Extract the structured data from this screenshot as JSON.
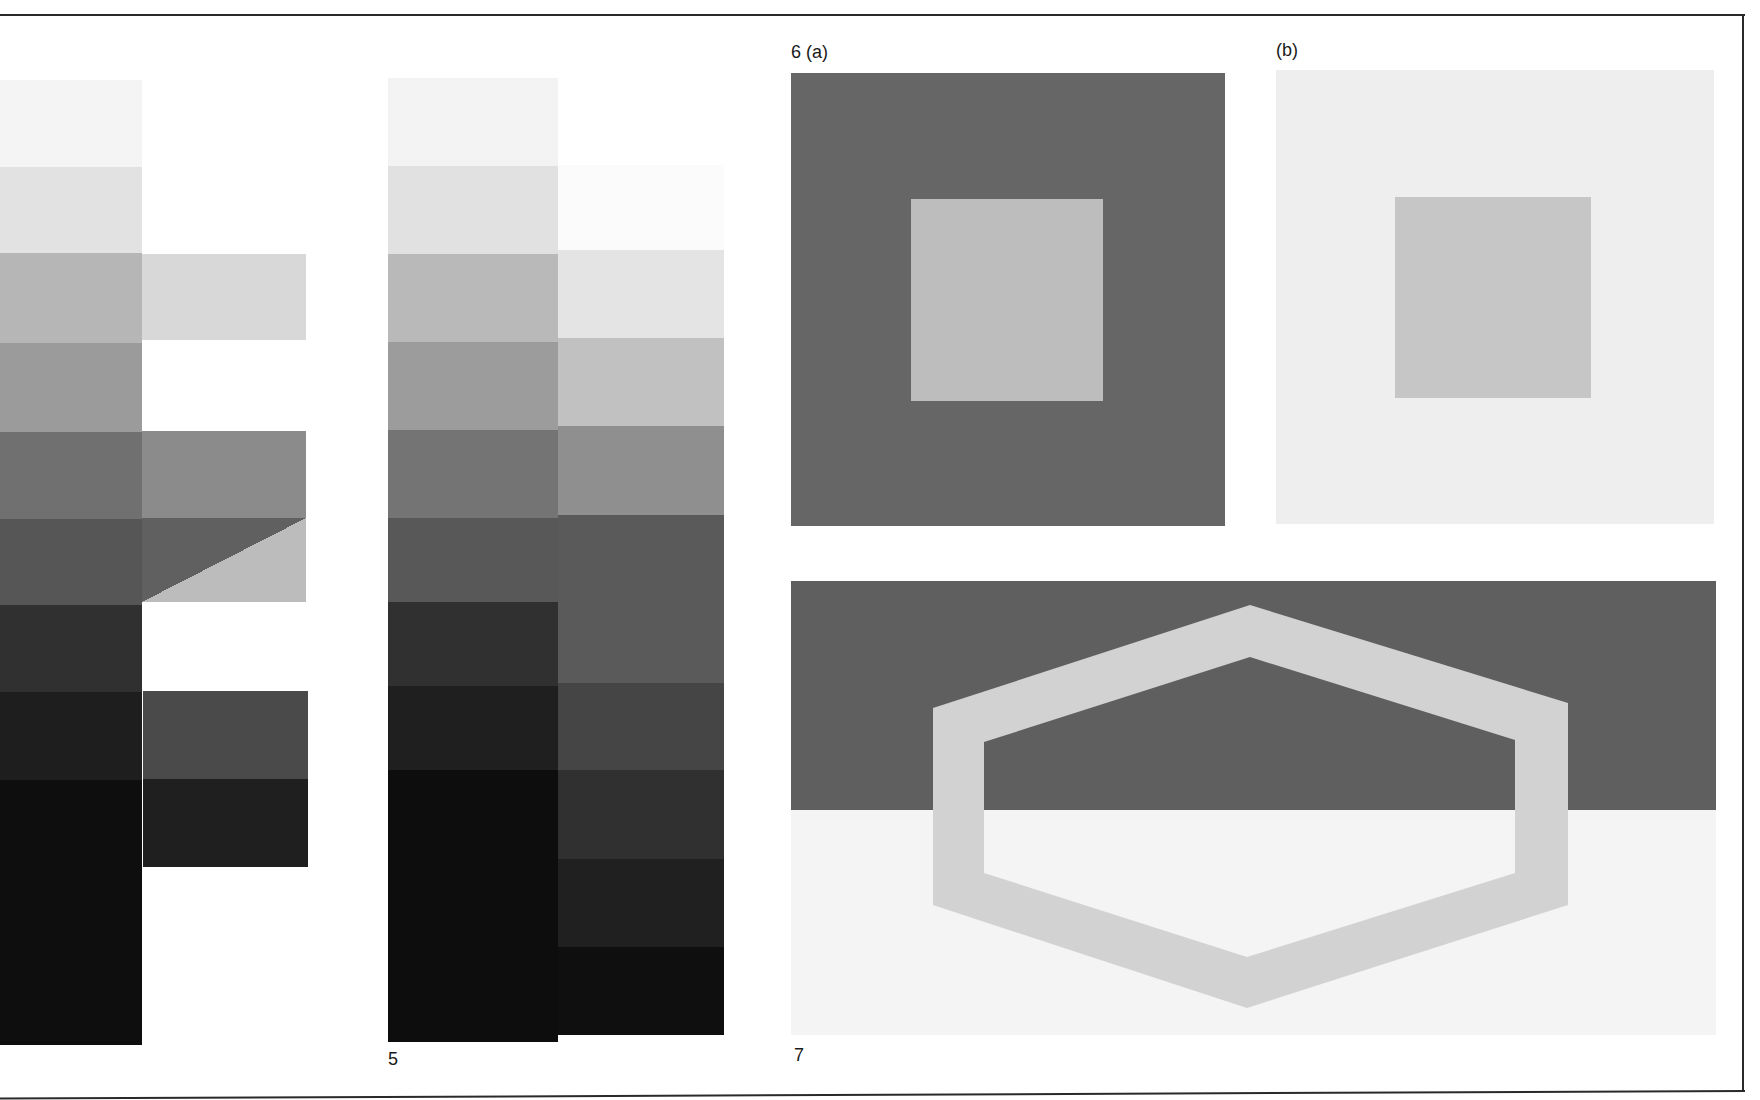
{
  "labels": {
    "fig5": "5",
    "fig6a": "6 (a)",
    "fig6b": "(b)",
    "fig7": "7"
  },
  "figure_left": {
    "description": "grey-scale step column with comparison patches",
    "column": {
      "x": 0,
      "width": 142,
      "steps": [
        {
          "y": 80,
          "h": 87,
          "color": "#f4f4f4"
        },
        {
          "y": 167,
          "h": 86,
          "color": "#e2e2e2"
        },
        {
          "y": 253,
          "h": 90,
          "color": "#b6b6b6"
        },
        {
          "y": 343,
          "h": 89,
          "color": "#9b9b9b"
        },
        {
          "y": 432,
          "h": 87,
          "color": "#707070"
        },
        {
          "y": 519,
          "h": 86,
          "color": "#565656"
        },
        {
          "y": 605,
          "h": 87,
          "color": "#303030"
        },
        {
          "y": 692,
          "h": 88,
          "color": "#1e1e1e"
        },
        {
          "y": 780,
          "h": 265,
          "color": "#0e0e0e"
        }
      ]
    },
    "patches": [
      {
        "x": 142,
        "y": 254,
        "w": 164,
        "h": 86,
        "color": "#d8d8d8"
      },
      {
        "x": 142,
        "y": 431,
        "w": 164,
        "h": 87,
        "color": "#8b8b8b"
      },
      {
        "x": 142,
        "y": 518,
        "w": 164,
        "h": 84,
        "color": "#606060",
        "diagonal_color": "#bcbcbc"
      },
      {
        "x": 143,
        "y": 691,
        "w": 165,
        "h": 88,
        "color": "#4a4a4a"
      },
      {
        "x": 143,
        "y": 779,
        "w": 165,
        "h": 88,
        "color": "#1f1f1f"
      }
    ]
  },
  "figure_5": {
    "left_column": {
      "x": 388,
      "width": 170,
      "steps": [
        {
          "y": 78,
          "h": 88,
          "color": "#f3f3f3"
        },
        {
          "y": 166,
          "h": 88,
          "color": "#e1e1e1"
        },
        {
          "y": 254,
          "h": 88,
          "color": "#b9b9b9"
        },
        {
          "y": 342,
          "h": 88,
          "color": "#9c9c9c"
        },
        {
          "y": 430,
          "h": 88,
          "color": "#747474"
        },
        {
          "y": 518,
          "h": 84,
          "color": "#585858"
        },
        {
          "y": 602,
          "h": 84,
          "color": "#303030"
        },
        {
          "y": 686,
          "h": 84,
          "color": "#1f1f1f"
        },
        {
          "y": 770,
          "h": 272,
          "color": "#0d0d0d"
        }
      ]
    },
    "right_column": {
      "x": 558,
      "width": 166,
      "steps": [
        {
          "y": 165,
          "h": 85,
          "color": "#fbfbfb"
        },
        {
          "y": 250,
          "h": 88,
          "color": "#e4e4e4"
        },
        {
          "y": 338,
          "h": 88,
          "color": "#c1c1c1"
        },
        {
          "y": 426,
          "h": 89,
          "color": "#8f8f8f"
        },
        {
          "y": 515,
          "h": 168,
          "color": "#5a5a5a"
        },
        {
          "y": 683,
          "h": 87,
          "color": "#454545"
        },
        {
          "y": 770,
          "h": 89,
          "color": "#303030"
        },
        {
          "y": 859,
          "h": 88,
          "color": "#202020"
        },
        {
          "y": 947,
          "h": 88,
          "color": "#0f0f0f"
        }
      ]
    }
  },
  "figure_6a": {
    "outer": {
      "x": 791,
      "y": 73,
      "w": 434,
      "h": 453,
      "color": "#666666"
    },
    "inner": {
      "x": 911,
      "y": 199,
      "w": 192,
      "h": 202,
      "color": "#bdbdbd"
    }
  },
  "figure_6b": {
    "outer": {
      "x": 1276,
      "y": 70,
      "w": 438,
      "h": 454,
      "color": "#eeeeee"
    },
    "inner": {
      "x": 1395,
      "y": 197,
      "w": 196,
      "h": 201,
      "color": "#c6c6c6"
    }
  },
  "figure_7": {
    "rect": {
      "x": 791,
      "y": 581,
      "w": 925,
      "h": 454
    },
    "top_color": "#5f5f5f",
    "bottom_color": "#f4f4f4",
    "horizon_y": 810,
    "hexagon_color": "#d2d2d2",
    "hexagon_outer": [
      [
        1250,
        605
      ],
      [
        1568,
        703
      ],
      [
        1568,
        905
      ],
      [
        1247,
        1008
      ],
      [
        933,
        905
      ],
      [
        933,
        708
      ]
    ],
    "hexagon_inner": [
      [
        1250,
        657
      ],
      [
        1515,
        740
      ],
      [
        1515,
        873
      ],
      [
        1247,
        957
      ],
      [
        984,
        873
      ],
      [
        984,
        742
      ]
    ]
  }
}
